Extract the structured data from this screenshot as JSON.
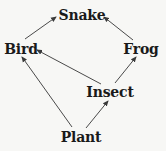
{
  "diagram": {
    "type": "food-web",
    "colors": {
      "background": "#f7f7f5",
      "text": "#1a1a1a",
      "arrow": "#4a4a4a"
    },
    "nodes": [
      {
        "id": "snake",
        "label": "Snake",
        "x": 82,
        "y": 15
      },
      {
        "id": "bird",
        "label": "Bird",
        "x": 21,
        "y": 49
      },
      {
        "id": "frog",
        "label": "Frog",
        "x": 141,
        "y": 49
      },
      {
        "id": "insect",
        "label": "Insect",
        "x": 110,
        "y": 92
      },
      {
        "id": "plant",
        "label": "Plant",
        "x": 81,
        "y": 137
      }
    ],
    "edges": [
      {
        "from": "bird",
        "to": "snake",
        "x1": 25,
        "y1": 39,
        "x2": 56,
        "y2": 17
      },
      {
        "from": "frog",
        "to": "snake",
        "x1": 133,
        "y1": 40,
        "x2": 104,
        "y2": 17
      },
      {
        "from": "insect",
        "to": "bird",
        "x1": 101,
        "y1": 84,
        "x2": 37,
        "y2": 50
      },
      {
        "from": "insect",
        "to": "frog",
        "x1": 115,
        "y1": 83,
        "x2": 136,
        "y2": 57
      },
      {
        "from": "plant",
        "to": "bird",
        "x1": 72,
        "y1": 127,
        "x2": 22,
        "y2": 57
      },
      {
        "from": "plant",
        "to": "insect",
        "x1": 86,
        "y1": 128,
        "x2": 108,
        "y2": 101
      }
    ]
  }
}
